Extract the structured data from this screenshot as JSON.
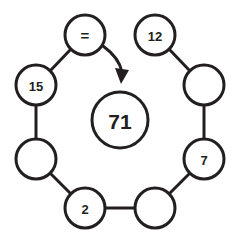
{
  "diagram": {
    "title": "Ring of circles with central value",
    "background_color": "#ffffff",
    "stroke_color": "#231f20",
    "center": {
      "label": "71",
      "cx": 120,
      "cy": 120,
      "r": 28
    },
    "nodes": [
      {
        "id": "node-top",
        "label": "=",
        "cx": 85,
        "cy": 35,
        "r": 20,
        "empty": false
      },
      {
        "id": "node-top-right",
        "label": "12",
        "cx": 155,
        "cy": 35,
        "r": 20,
        "empty": false
      },
      {
        "id": "node-right",
        "label": "",
        "cx": 204,
        "cy": 85,
        "r": 20,
        "empty": true
      },
      {
        "id": "node-bottom-right",
        "label": "7",
        "cx": 204,
        "cy": 159,
        "r": 20,
        "empty": false
      },
      {
        "id": "node-bottom",
        "label": "",
        "cx": 155,
        "cy": 208,
        "r": 20,
        "empty": true
      },
      {
        "id": "node-bottom-left",
        "label": "2",
        "cx": 85,
        "cy": 208,
        "r": 20,
        "empty": false
      },
      {
        "id": "node-left",
        "label": "",
        "cx": 36,
        "cy": 159,
        "r": 20,
        "empty": true
      },
      {
        "id": "node-top-left",
        "label": "15",
        "cx": 36,
        "cy": 85,
        "r": 20,
        "empty": false
      }
    ],
    "arrow": {
      "name": "equals-to-center-arrow",
      "from": "node-top",
      "to": "center",
      "path": "M 103 46 C 114 54, 120 62, 122 72",
      "head_points": "115,68 129,70 121,84"
    }
  }
}
